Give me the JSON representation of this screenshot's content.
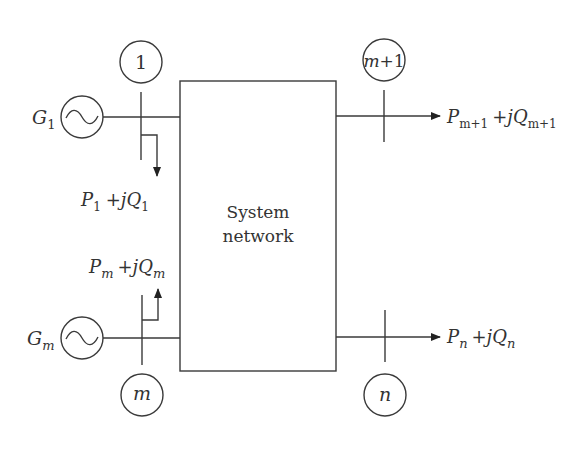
{
  "diagram": {
    "network_box": {
      "line1": "System",
      "line2": "network"
    },
    "buses": [
      {
        "id": "bus-1",
        "label": "1"
      },
      {
        "id": "bus-m",
        "label": "m"
      },
      {
        "id": "bus-m-plus-1",
        "label_main": "m",
        "label_rest": "+1"
      },
      {
        "id": "bus-n",
        "label": "n"
      }
    ],
    "generators": [
      {
        "id": "G1",
        "symbol": "G",
        "subscript": "1"
      },
      {
        "id": "Gm",
        "symbol": "G",
        "subscript": "m"
      }
    ],
    "flows": {
      "bus1_load": {
        "P": "P",
        "P_sub": "1",
        "plus": "+",
        "j": "j",
        "Q": "Q",
        "Q_sub": "1"
      },
      "busm_injection": {
        "P": "P",
        "P_sub": "m",
        "plus": "+",
        "j": "j",
        "Q": "Q",
        "Q_sub": "m"
      },
      "busm1_out": {
        "P": "P",
        "P_sub": "m+1",
        "plus": "+",
        "j": "j",
        "Q": "Q",
        "Q_sub": "m+1"
      },
      "busn_out": {
        "P": "P",
        "P_sub": "n",
        "plus": "+",
        "j": "j",
        "Q": "Q",
        "Q_sub": "n"
      }
    },
    "generator_glyph": "~"
  }
}
